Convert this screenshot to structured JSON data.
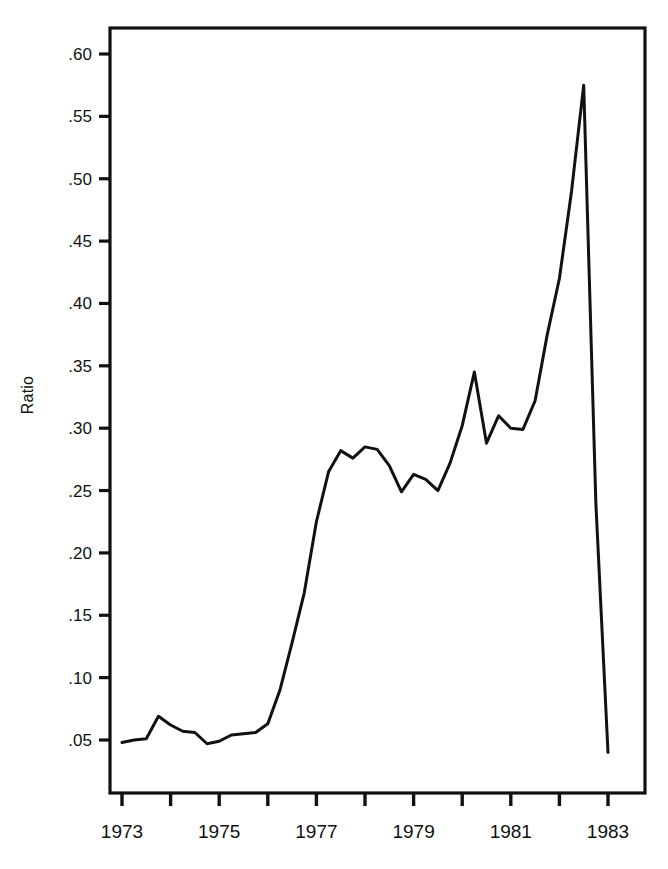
{
  "chart_data": {
    "type": "line",
    "title": "",
    "xlabel": "",
    "ylabel": "Ratio",
    "xlim": [
      1972.75,
      1983.3
    ],
    "ylim": [
      0.0,
      0.625
    ],
    "grid": false,
    "legend": null,
    "ytick_labels": [
      ".05",
      ".10",
      ".15",
      ".20",
      ".25",
      ".30",
      ".35",
      ".40",
      ".45",
      ".50",
      ".55",
      ".60"
    ],
    "ytick_values": [
      0.05,
      0.1,
      0.15,
      0.2,
      0.25,
      0.3,
      0.35,
      0.4,
      0.45,
      0.5,
      0.55,
      0.6
    ],
    "xtick_values": [
      1973,
      1974,
      1975,
      1976,
      1977,
      1978,
      1979,
      1980,
      1981,
      1982,
      1983
    ],
    "xtick_labels": [
      "1973",
      "",
      "1975",
      "",
      "1977",
      "",
      "1979",
      "",
      "1981",
      "",
      "1983"
    ],
    "series": [
      {
        "name": "Ratio",
        "color": "#111111",
        "x": [
          1973.0,
          1973.25,
          1973.5,
          1973.75,
          1974.0,
          1974.25,
          1974.5,
          1974.75,
          1975.0,
          1975.25,
          1975.5,
          1975.75,
          1976.0,
          1976.25,
          1976.5,
          1976.75,
          1977.0,
          1977.25,
          1977.5,
          1977.75,
          1978.0,
          1978.25,
          1978.5,
          1978.75,
          1979.0,
          1979.25,
          1979.5,
          1979.75,
          1980.0,
          1980.25,
          1980.5,
          1980.75,
          1981.0,
          1981.25,
          1981.5,
          1981.75,
          1982.0,
          1982.25,
          1982.5,
          1982.75,
          1983.0
        ],
        "y": [
          0.048,
          0.05,
          0.051,
          0.069,
          0.062,
          0.057,
          0.056,
          0.047,
          0.049,
          0.054,
          0.055,
          0.056,
          0.063,
          0.09,
          0.128,
          0.168,
          0.225,
          0.265,
          0.282,
          0.276,
          0.285,
          0.283,
          0.27,
          0.249,
          0.263,
          0.259,
          0.25,
          0.272,
          0.302,
          0.345,
          0.288,
          0.31,
          0.3,
          0.299,
          0.322,
          0.375,
          0.42,
          0.49,
          0.575,
          0.24,
          0.04
        ]
      }
    ]
  }
}
